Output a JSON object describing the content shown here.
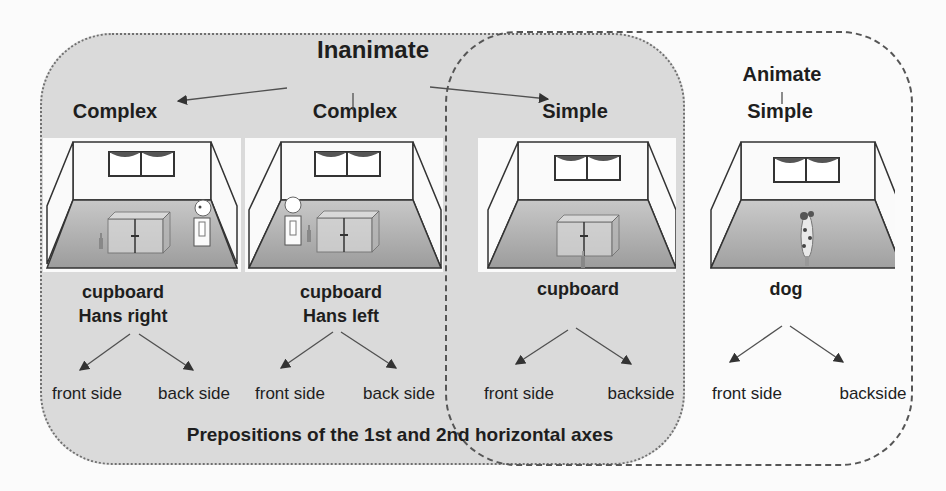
{
  "diagram": {
    "top_categories": [
      {
        "label": "Inanimate",
        "x": 373,
        "y": 46
      },
      {
        "label": "Animate",
        "x": 782,
        "y": 63
      }
    ],
    "columns": [
      {
        "complexity": "Complex",
        "object_lines": [
          "cupboard",
          "Hans right"
        ],
        "room": {
          "x": 43,
          "y": 138,
          "cupboard": true,
          "bottle": "left",
          "person": "right",
          "dog": false
        },
        "sides": [
          "front side",
          "back side"
        ],
        "center_x": 140
      },
      {
        "complexity": "Complex",
        "object_lines": [
          "cupboard",
          "Hans left"
        ],
        "room": {
          "x": 245,
          "y": 138,
          "cupboard": true,
          "bottle": "left-mid",
          "person": "left",
          "dog": false
        },
        "sides": [
          "front side",
          "back side"
        ],
        "center_x": 342
      },
      {
        "complexity": "Simple",
        "object_lines": [
          "cupboard"
        ],
        "room": {
          "x": 478,
          "y": 138,
          "cupboard": true,
          "bottle": "front",
          "person": "none",
          "dog": false
        },
        "sides": [
          "front side",
          "backside"
        ],
        "center_x": 577
      },
      {
        "complexity": "Simple",
        "object_lines": [
          "dog"
        ],
        "room": {
          "x": 697,
          "y": 138,
          "cupboard": false,
          "bottle": "none",
          "person": "none",
          "dog": true
        },
        "sides": [
          "front side",
          "backside"
        ],
        "center_x": 796
      }
    ],
    "footer": "Prepositions of the 1st and 2nd horizontal axes",
    "groups": {
      "inanimate_box": {
        "style": "dotted",
        "fill": "#dadada"
      },
      "simple_box": {
        "style": "dashed",
        "stroke": "#555555"
      }
    },
    "colors": {
      "text": "#1e1e1e",
      "arrow": "#505050",
      "floor": "#a8a8a8",
      "wall": "#fafafa"
    }
  }
}
